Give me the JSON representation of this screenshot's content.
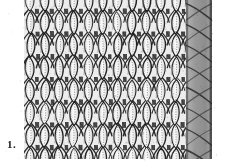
{
  "figure": {
    "label": "1.",
    "caption_text": "1.",
    "render_style": "black-and-white halftone scan",
    "width_px": 227,
    "height_px": 167
  },
  "canvas": {
    "background_color": "#fdfdfd",
    "paper_color": "#ffffff"
  },
  "fabric": {
    "left_px": 23,
    "right_px": 212,
    "top_px": 0,
    "bottom_px": 159,
    "wale_count": 13,
    "course_count": 8,
    "wale_spacing_px": 14.6,
    "course_spacing_px": 22.5,
    "stitch_fill_color": "#e9e9e9",
    "stitch_highlight_color": "#f6f6f6",
    "yarn_stroke_color": "#1c1c1c",
    "ply_dot_color": "#4a4a4a",
    "shadow_color": "#8f8f8f"
  },
  "selvedge": {
    "label": "shaded edge column",
    "left_px": 186,
    "width_px": 26,
    "fill_color": "#9a9a9a",
    "stroke_color": "#2a2a2a"
  },
  "margins": {
    "left_margin_px": 23,
    "right_margin_px": 15,
    "bottom_margin_px": 8
  },
  "chart_data": {
    "type": "heatmap",
    "title": "1.",
    "xlabel": "",
    "ylabel": "",
    "categories": [
      "wale 1",
      "wale 2",
      "wale 3",
      "wale 4",
      "wale 5",
      "wale 6",
      "wale 7",
      "wale 8",
      "wale 9",
      "wale 10",
      "wale 11",
      "wale 12",
      "wale 13"
    ],
    "series": [
      {
        "name": "course 1",
        "values": [
          1,
          1,
          1,
          1,
          1,
          1,
          1,
          1,
          1,
          1,
          1,
          1,
          1
        ]
      },
      {
        "name": "course 2",
        "values": [
          1,
          1,
          1,
          1,
          1,
          1,
          1,
          1,
          1,
          1,
          1,
          1,
          1
        ]
      },
      {
        "name": "course 3",
        "values": [
          1,
          1,
          1,
          1,
          1,
          1,
          1,
          1,
          1,
          1,
          1,
          1,
          1
        ]
      },
      {
        "name": "course 4",
        "values": [
          1,
          1,
          1,
          1,
          1,
          1,
          1,
          1,
          1,
          1,
          1,
          1,
          1
        ]
      },
      {
        "name": "course 5",
        "values": [
          1,
          1,
          1,
          1,
          1,
          1,
          1,
          1,
          1,
          1,
          1,
          1,
          1
        ]
      },
      {
        "name": "course 6",
        "values": [
          1,
          1,
          1,
          1,
          1,
          1,
          1,
          1,
          1,
          1,
          1,
          1,
          1
        ]
      },
      {
        "name": "course 7",
        "values": [
          1,
          1,
          1,
          1,
          1,
          1,
          1,
          1,
          1,
          1,
          1,
          1,
          1
        ]
      },
      {
        "name": "course 8",
        "values": [
          1,
          1,
          1,
          1,
          1,
          1,
          1,
          1,
          1,
          1,
          1,
          1,
          1
        ]
      }
    ],
    "legend": [],
    "grid": false
  }
}
